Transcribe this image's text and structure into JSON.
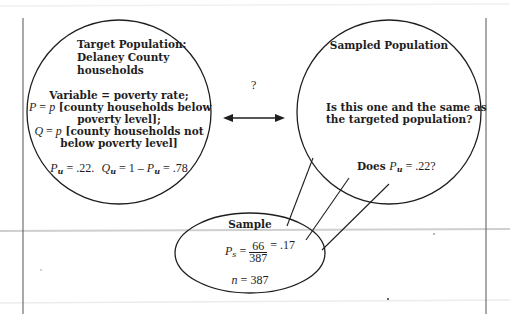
{
  "target_population": {
    "title_lines": [
      "Target Population:",
      "Delaney County",
      "households"
    ],
    "variable_line": "Variable = poverty rate;",
    "p_def": {
      "symbol": "P",
      "eq": " = ",
      "p": "p",
      "rest": " [county households below",
      "line2": "poverty level];"
    },
    "q_def": {
      "symbol": "Q",
      "eq": " = ",
      "p": "p",
      "rest": " [county households not",
      "line2": "below poverty level]"
    },
    "values": {
      "pu_symbol": "P",
      "pu_sub": "u",
      "pu_value": " = .22.",
      "qu_symbol": "Q",
      "qu_sub": "u",
      "qu_mid": " = 1 – ",
      "pu2_symbol": "P",
      "pu2_sub": "u",
      "qu_value": " = .78"
    }
  },
  "connector": {
    "question_mark": "?",
    "arrow": "double-headed-arrow"
  },
  "sampled_population": {
    "title": "Sampled Population",
    "question_line1": "Is this one and the same as",
    "question_line2": "the targeted population?",
    "check": {
      "prefix": "Does ",
      "symbol": "P",
      "sub": "u",
      "suffix": " = .22?"
    }
  },
  "sample": {
    "title": "Sample",
    "ps": {
      "symbol": "P",
      "sub": "s",
      "eq": " = ",
      "numerator": "66",
      "denominator": "387",
      "result": " = .17"
    },
    "n": {
      "symbol": "n",
      "value": " = 387"
    }
  },
  "colors": {
    "stroke": "#1e1e1e",
    "background": "#ffffff",
    "scan_line": "#c8c8c8"
  }
}
